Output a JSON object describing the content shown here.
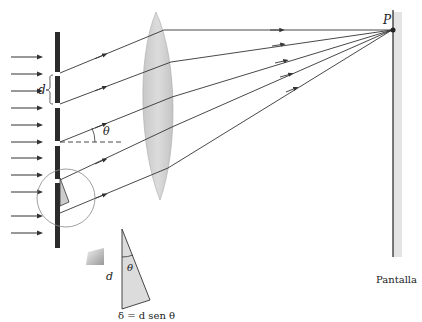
{
  "figure": {
    "labels": {
      "slit_spacing": "d",
      "angle": "θ",
      "point": "P",
      "screen": "Pantalla",
      "inset_side": "d",
      "inset_angle": "θ",
      "path_difference": "δ = d sen θ"
    },
    "colors": {
      "line": "#333333",
      "grating": "#2b2b2b",
      "lens": "#d2d2d2",
      "screen_shade": "#e4e4e4",
      "triangle_fill": "#dcdcdc"
    },
    "incident_arrow_count": 11,
    "diffracted_ray_count": 5
  }
}
